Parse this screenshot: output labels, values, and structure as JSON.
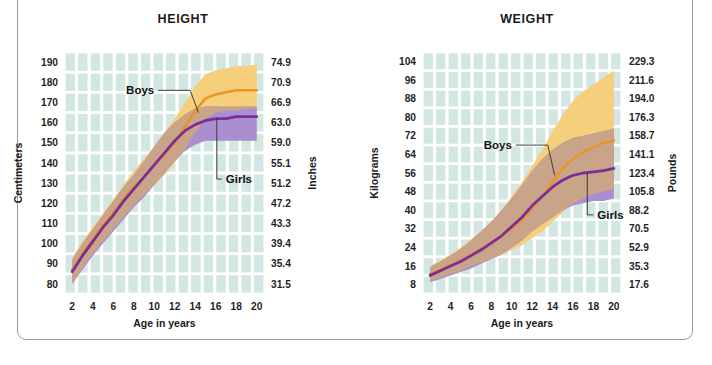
{
  "figure": {
    "background_color": "#ffffff",
    "frame_color": "#9a9a9a"
  },
  "palette": {
    "grid_fill": "#d2e6e2",
    "grid_line": "#ffffff",
    "boys_band": "#f6cf7c",
    "girls_band": "#a98fd0",
    "overlap_band": "#c9a489",
    "boys_line": "#e8962a",
    "girls_line": "#7b2f96",
    "text": "#1b1b1b"
  },
  "charts": [
    {
      "id": "height",
      "title": "HEIGHT",
      "xlabel": "Age in years",
      "ylabel_left": "Centimeters",
      "ylabel_right": "Inches",
      "xticks": [
        2,
        4,
        6,
        8,
        10,
        12,
        14,
        16,
        18,
        20
      ],
      "yticks_left": [
        190,
        180,
        170,
        160,
        150,
        140,
        130,
        120,
        110,
        100,
        90,
        80
      ],
      "yticks_right": [
        "74.9",
        "70.9",
        "66.9",
        "63.0",
        "59.0",
        "55.1",
        "51.2",
        "47.2",
        "43.3",
        "39.4",
        "35.4",
        "31.5"
      ],
      "ylim": [
        75,
        195
      ],
      "xlim": [
        1.2,
        20.8
      ],
      "annotations": [
        {
          "label": "Boys",
          "x": 10.0,
          "y": 176.0
        },
        {
          "label": "Girls",
          "x": 16.2,
          "y": 132.0
        }
      ],
      "chart_data": {
        "type": "area",
        "title": "HEIGHT",
        "xlabel": "Age in years",
        "ylabel": "Centimeters",
        "ylim": [
          75,
          195
        ],
        "grid": true,
        "legend": "inline-annotations",
        "x": [
          2,
          3,
          4,
          5,
          6,
          7,
          8,
          9,
          10,
          11,
          12,
          13,
          14,
          15,
          16,
          17,
          18,
          19,
          20
        ],
        "series": [
          {
            "name": "Boys",
            "color": "#e8962a",
            "values": [
              87,
              95,
              102,
              109,
              115,
              122,
              128,
              133,
              139,
              144,
              150,
              158,
              166,
              172,
              174,
              175,
              176,
              176,
              176
            ],
            "band_low": [
              80,
              88,
              95,
              101,
              107,
              113,
              119,
              124,
              129,
              134,
              140,
              147,
              155,
              162,
              165,
              166,
              166,
              167,
              167
            ],
            "band_high": [
              93,
              101,
              108,
              115,
              122,
              129,
              136,
              142,
              148,
              155,
              162,
              170,
              178,
              184,
              186,
              187,
              188,
              188,
              189
            ]
          },
          {
            "name": "Girls",
            "color": "#7b2f96",
            "values": [
              86,
              94,
              101,
              108,
              114,
              121,
              127,
              133,
              139,
              145,
              151,
              156,
              159,
              161,
              162,
              162,
              163,
              163,
              163
            ],
            "band_low": [
              80,
              87,
              94,
              100,
              106,
              112,
              118,
              123,
              129,
              135,
              141,
              146,
              149,
              151,
              151,
              151,
              151,
              151,
              151
            ],
            "band_high": [
              92,
              100,
              107,
              114,
              121,
              128,
              134,
              141,
              148,
              155,
              160,
              164,
              167,
              168,
              168,
              168,
              168,
              168,
              168
            ]
          }
        ]
      }
    },
    {
      "id": "weight",
      "title": "WEIGHT",
      "xlabel": "Age in years",
      "ylabel_left": "Kilograms",
      "ylabel_right": "Pounds",
      "xticks": [
        2,
        4,
        6,
        8,
        10,
        12,
        14,
        16,
        18,
        20
      ],
      "yticks_left": [
        104,
        96,
        88,
        80,
        72,
        64,
        56,
        48,
        40,
        32,
        24,
        16,
        8
      ],
      "yticks_right": [
        "229.3",
        "211.6",
        "194.0",
        "176.3",
        "158.7",
        "141.1",
        "123.4",
        "105.8",
        "88.2",
        "70.5",
        "52.9",
        "35.3",
        "17.6"
      ],
      "ylim": [
        4,
        108
      ],
      "xlim": [
        1.2,
        20.8
      ],
      "annotations": [
        {
          "label": "Boys",
          "x": 10.0,
          "y": 68.0
        },
        {
          "label": "Girls",
          "x": 17.6,
          "y": 38.0
        }
      ],
      "chart_data": {
        "type": "area",
        "title": "WEIGHT",
        "xlabel": "Age in years",
        "ylabel": "Kilograms",
        "ylim": [
          4,
          108
        ],
        "grid": true,
        "legend": "inline-annotations",
        "x": [
          2,
          3,
          4,
          5,
          6,
          7,
          8,
          9,
          10,
          11,
          12,
          13,
          14,
          15,
          16,
          17,
          18,
          19,
          20
        ],
        "series": [
          {
            "name": "Boys",
            "color": "#e8962a",
            "values": [
              12.5,
              14.5,
              16.5,
              18.5,
              21,
              23.5,
              26,
              29,
              32,
              36,
              41,
              46,
              52,
              58,
              62,
              65,
              67,
              69,
              70
            ],
            "band_low": [
              9.5,
              11,
              12.5,
              14,
              16,
              17.5,
              19,
              21,
              23,
              25,
              28,
              31,
              35,
              39,
              43,
              45,
              47,
              48,
              49
            ],
            "band_high": [
              16,
              18.5,
              21,
              24,
              27.5,
              31,
              35,
              40,
              46,
              52,
              59,
              66,
              74,
              81,
              87,
              91,
              94,
              97,
              100
            ]
          },
          {
            "name": "Girls",
            "color": "#7b2f96",
            "values": [
              12,
              14,
              16,
              18,
              20.5,
              23,
              26,
              29,
              33,
              37,
              42,
              46,
              50,
              53,
              55,
              56,
              56.5,
              57,
              58
            ],
            "band_low": [
              9,
              10.5,
              12,
              13.5,
              15,
              17,
              19,
              21,
              24,
              27,
              31,
              34,
              37,
              40,
              42,
              43,
              44,
              44,
              45
            ],
            "band_high": [
              15.5,
              18,
              20.5,
              23.5,
              27,
              31,
              35,
              40,
              45,
              51,
              57,
              62,
              66,
              69,
              71,
              72,
              73,
              74,
              75
            ]
          }
        ]
      }
    }
  ]
}
